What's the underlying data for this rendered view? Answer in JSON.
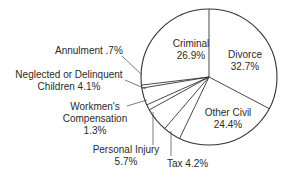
{
  "chart_data": {
    "type": "pie",
    "title": "",
    "categories": [
      "Divorce",
      "Other Civil",
      "Tax",
      "Personal Injury",
      "Workmen's Compensation",
      "Neglected or Delinquent Children",
      "Annulment",
      "Criminal"
    ],
    "values": [
      32.7,
      24.4,
      4.2,
      5.7,
      1.3,
      4.1,
      0.7,
      26.9
    ],
    "units": "%",
    "labels": {
      "criminal": {
        "name": "Criminal",
        "value": "26.9%"
      },
      "divorce": {
        "name": "Divorce",
        "value": "32.7%"
      },
      "other_civil": {
        "name": "Other Civil",
        "value": "24.4%"
      },
      "tax": {
        "text": "Tax 4.2%"
      },
      "personal_injury": {
        "name": "Personal Injury",
        "value": "5.7%"
      },
      "workmens": {
        "line1": "Workmen's",
        "line2": "Compensation",
        "value": "1.3%"
      },
      "neglected": {
        "line1": "Neglected or Delinquent",
        "line2": "Children 4.1%"
      },
      "annulment": {
        "text": "Annulment .7%"
      }
    },
    "colors": {
      "fill": "#ffffff",
      "stroke": "#333333"
    }
  }
}
